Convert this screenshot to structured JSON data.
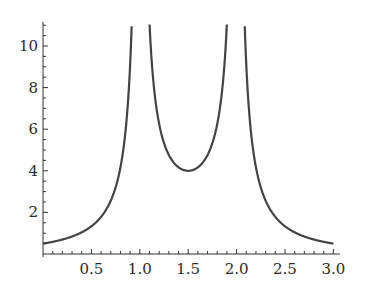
{
  "chart_data": {
    "type": "line",
    "title": "",
    "xlabel": "",
    "ylabel": "",
    "function": "y = 1 / |(x - 1)(x - 2)|",
    "xlim": [
      0,
      3.05
    ],
    "ylim": [
      0,
      11
    ],
    "grid": false,
    "legend": null,
    "x_ticks": [
      "0.5",
      "1.0",
      "1.5",
      "2.0",
      "2.5",
      "3.0"
    ],
    "x_tick_values": [
      0.5,
      1.0,
      1.5,
      2.0,
      2.5,
      3.0
    ],
    "y_ticks": [
      "2",
      "4",
      "6",
      "8",
      "10"
    ],
    "y_tick_values": [
      2,
      4,
      6,
      8,
      10
    ],
    "series": [
      {
        "name": "f(x)",
        "color": "#444444",
        "x": [
          0.0,
          0.25,
          0.5,
          0.75,
          0.9,
          1.1,
          1.25,
          1.5,
          1.75,
          1.9,
          2.1,
          2.25,
          2.5,
          2.75,
          3.0
        ],
        "y": [
          0.5,
          0.76,
          1.33,
          3.2,
          9.09,
          9.09,
          5.33,
          4.0,
          5.33,
          9.09,
          9.09,
          3.2,
          1.33,
          0.76,
          0.5
        ]
      }
    ],
    "asymptotes_x": [
      1.0,
      2.0
    ]
  }
}
